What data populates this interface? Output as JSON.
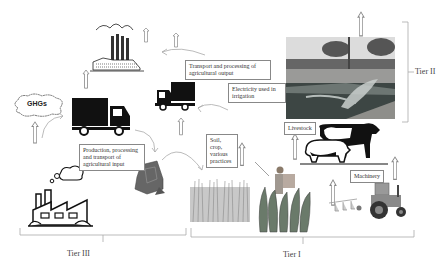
{
  "diagram": {
    "labels": {
      "ghgs": "GHGs",
      "transport_output": "Transport and processing of agricultural output",
      "electricity": "Electricity used in irrigation",
      "production_input": "Production, processing and transport of agricultural input",
      "soil_crop": "Soil, crop, various practices",
      "livestock": "Livestock",
      "machinery": "Machinery"
    },
    "tiers": {
      "tier1": "Tier I",
      "tier2": "Tier II",
      "tier3": "Tier III"
    },
    "icons": [
      "factory-smoke-icon",
      "truck-icon",
      "cloud-icon",
      "factory-icon",
      "fertilizer-bag-icon",
      "wheat-field-icon",
      "farmer-sprayer-icon",
      "cow-icon",
      "pig-icon",
      "tractor-icon",
      "irrigation-photo",
      "up-arrow-icon",
      "curved-arrow-icon"
    ],
    "colors": {
      "line": "#999999",
      "icon": "#111111",
      "photo_water": "#5b6b66"
    }
  }
}
